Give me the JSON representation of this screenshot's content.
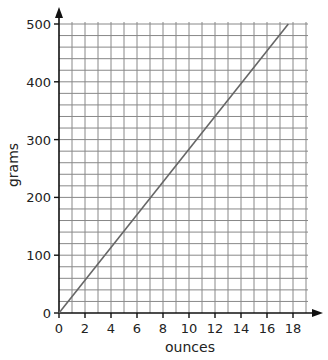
{
  "chart_data": {
    "type": "line",
    "title": "",
    "xlabel": "ounces",
    "ylabel": "grams",
    "xlim": [
      0,
      19
    ],
    "ylim": [
      0,
      500
    ],
    "x_ticks": [
      0,
      2,
      4,
      6,
      8,
      10,
      12,
      14,
      16,
      18
    ],
    "y_ticks": [
      0,
      100,
      200,
      300,
      400,
      500
    ],
    "grid": true,
    "grid_minor_x_step": 1,
    "grid_minor_y_step": 20,
    "legend": null,
    "series": [
      {
        "name": "ounces to grams conversion",
        "x": [
          0,
          17.64
        ],
        "y": [
          0,
          500
        ],
        "color": "#666666"
      }
    ]
  },
  "colors": {
    "grid": "#888888",
    "axis": "#111111",
    "line": "#666666"
  }
}
